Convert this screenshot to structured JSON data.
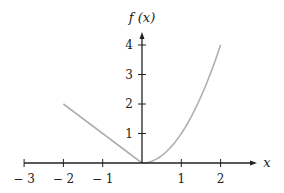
{
  "chart_data": {
    "type": "line",
    "title": "",
    "xlabel": "x",
    "ylabel": "f (x)",
    "xlim": [
      -3,
      2.8
    ],
    "ylim": [
      0,
      4.4
    ],
    "x_ticks": [
      -3,
      -2,
      -1,
      0,
      1,
      2
    ],
    "x_tick_labels": [
      "− 3",
      "− 2",
      "− 1",
      "",
      "1",
      "2"
    ],
    "y_ticks": [
      1,
      2,
      3,
      4
    ],
    "y_tick_labels": [
      "1",
      "2",
      "3",
      "4"
    ],
    "grid": false,
    "legend": null,
    "series": [
      {
        "name": "f(x) = -x, -2 ≤ x ≤ 0",
        "color": "#b0b0b0",
        "x": [
          -2,
          0
        ],
        "y": [
          2,
          0
        ]
      },
      {
        "name": "f(x) = x^2, 0 ≤ x ≤ 2",
        "color": "#b0b0b0",
        "x": [
          0,
          0.25,
          0.5,
          0.75,
          1,
          1.25,
          1.5,
          1.75,
          2
        ],
        "y": [
          0,
          0.0625,
          0.25,
          0.5625,
          1,
          1.5625,
          2.25,
          3.0625,
          4
        ]
      }
    ],
    "axis_color": "#222222"
  }
}
